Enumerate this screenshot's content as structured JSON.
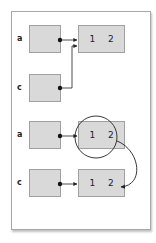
{
  "diagram": {
    "colors": {
      "box_fill": "#d9d9d9",
      "box_border": "#a0a0a0",
      "frame_border": "#a8a8a8",
      "line": "#222222"
    },
    "panels": [
      {
        "name": "shared-reference",
        "variables": [
          {
            "label": "a",
            "points_to": 0
          },
          {
            "label": "c",
            "points_to": 0
          }
        ],
        "objects": [
          {
            "values": [
              "1",
              "2"
            ]
          }
        ]
      },
      {
        "name": "copied-reference",
        "variables": [
          {
            "label": "a",
            "points_to": 0
          },
          {
            "label": "c",
            "points_to": 1
          }
        ],
        "objects": [
          {
            "values": [
              "1",
              "2"
            ],
            "highlighted": true
          },
          {
            "values": [
              "1",
              "2"
            ]
          }
        ]
      }
    ]
  },
  "labels": {
    "p1_a": "a",
    "p1_c": "c",
    "p2_a": "a",
    "p2_c": "c"
  },
  "values": {
    "p1_obj": [
      "1",
      "2"
    ],
    "p2_obj1": [
      "1",
      "2"
    ],
    "p2_obj2": [
      "1",
      "2"
    ]
  }
}
